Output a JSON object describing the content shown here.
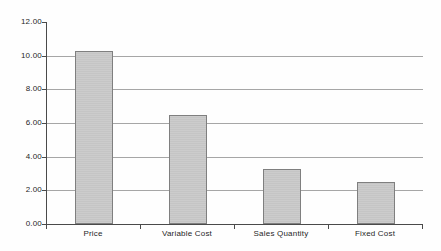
{
  "chart_data": {
    "type": "bar",
    "categories": [
      "Price",
      "Variable Cost",
      "Sales Quantity",
      "Fixed Cost"
    ],
    "values": [
      10.3,
      6.5,
      3.25,
      2.5
    ],
    "title": "",
    "xlabel": "",
    "ylabel": "",
    "ylim": [
      0,
      12
    ],
    "ytick_step": 2,
    "ytick_labels": [
      "0.00",
      "2.00",
      "4.00",
      "6.00",
      "8.00",
      "10.00",
      "12.00"
    ],
    "grid": "horizontal-major-only",
    "legend": "none",
    "series_name": "",
    "colors": {
      "bar_fill": "#c9c9c9",
      "bar_border": "#7f7f7f",
      "gridline": "#a6a6a6",
      "axis": "#4a4a4a",
      "text": "#1f1f1f",
      "background": "#fefefe"
    }
  }
}
